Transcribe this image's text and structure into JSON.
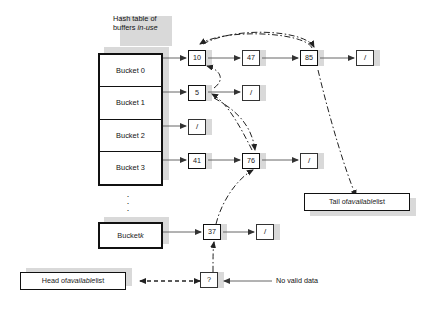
{
  "diagram": {
    "title_line1": "Hash table of",
    "title_line2_prefix": "buffers ",
    "title_line2_em": "in-use",
    "ellipsis": "⋮",
    "null_glyph": "/",
    "unknown_glyph": "?"
  },
  "hash_table": {
    "buckets": [
      {
        "label": "Bucket 0"
      },
      {
        "label": "Bucket 1"
      },
      {
        "label": "Bucket 2"
      },
      {
        "label": "Bucket 3"
      }
    ],
    "bucket_k_prefix": "Bucket ",
    "bucket_k_em": "k"
  },
  "chains": [
    {
      "bucket": "Bucket 0",
      "nodes": [
        "10",
        "47",
        "85",
        "/"
      ]
    },
    {
      "bucket": "Bucket 1",
      "nodes": [
        "5",
        "/"
      ]
    },
    {
      "bucket": "Bucket 2",
      "nodes": [
        "/"
      ]
    },
    {
      "bucket": "Bucket 3",
      "nodes": [
        "41",
        "76",
        "/"
      ]
    },
    {
      "bucket": "Bucket k",
      "nodes": [
        "37",
        "/"
      ]
    }
  ],
  "nodes": {
    "n10": "10",
    "n47": "47",
    "n85": "85",
    "null_b0": "/",
    "n5": "5",
    "null_b1": "/",
    "null_b2": "/",
    "n41": "41",
    "n76": "76",
    "null_b3": "/",
    "n37": "37",
    "null_bk": "/",
    "unknown": "?"
  },
  "labels": {
    "tail_prefix": "Tail of ",
    "tail_em": "available",
    "tail_suffix": " list",
    "head_prefix": "Head of ",
    "head_em": "available",
    "head_suffix": " list",
    "no_valid_data": "No valid data"
  },
  "available_list_order": [
    "?",
    "37",
    "76",
    "5",
    "10",
    "85"
  ],
  "colors": {
    "ink": "#111111",
    "line": "#555555",
    "shadow": "#d9d9d9",
    "background": "#ffffff"
  }
}
